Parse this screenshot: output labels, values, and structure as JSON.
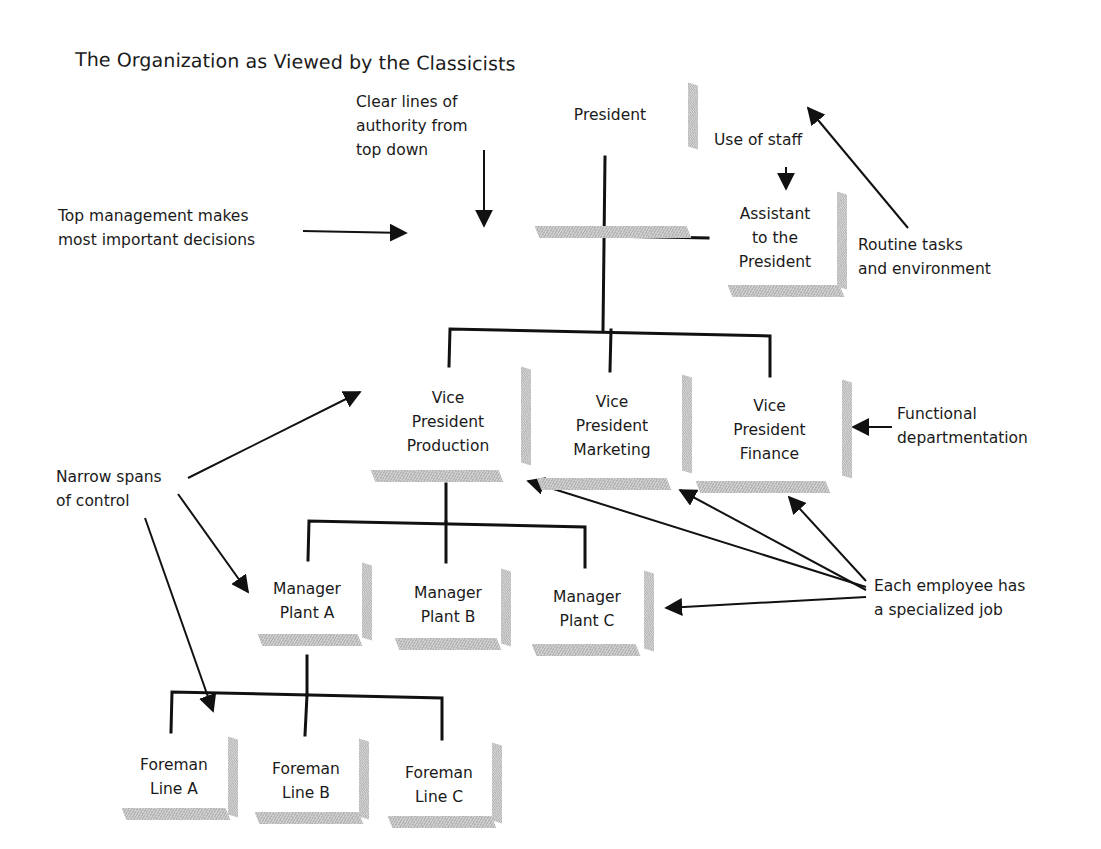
{
  "title": "The Organization as Viewed by the Classicists",
  "nodes": {
    "president": {
      "lines": [
        "President"
      ]
    },
    "assistant": {
      "lines": [
        "Assistant",
        "to the",
        "President"
      ]
    },
    "vp_production": {
      "lines": [
        "Vice",
        "President",
        "Production"
      ]
    },
    "vp_marketing": {
      "lines": [
        "Vice",
        "President",
        "Marketing"
      ]
    },
    "vp_finance": {
      "lines": [
        "Vice",
        "President",
        "Finance"
      ]
    },
    "manager_a": {
      "lines": [
        "Manager",
        "Plant A"
      ]
    },
    "manager_b": {
      "lines": [
        "Manager",
        "Plant B"
      ]
    },
    "manager_c": {
      "lines": [
        "Manager",
        "Plant C"
      ]
    },
    "foreman_a": {
      "lines": [
        "Foreman",
        "Line A"
      ]
    },
    "foreman_b": {
      "lines": [
        "Foreman",
        "Line B"
      ]
    },
    "foreman_c": {
      "lines": [
        "Foreman",
        "Line C"
      ]
    }
  },
  "annotations": {
    "clear_lines": {
      "lines": [
        "Clear lines of",
        "authority from",
        "top down"
      ]
    },
    "top_management": {
      "lines": [
        "Top management makes",
        "most important decisions"
      ]
    },
    "use_of_staff": {
      "lines": [
        "Use of staff"
      ]
    },
    "routine_tasks": {
      "lines": [
        "Routine tasks",
        "and environment"
      ]
    },
    "functional": {
      "lines": [
        "Functional",
        "departmentation"
      ]
    },
    "narrow_spans": {
      "lines": [
        "Narrow spans",
        "of control"
      ]
    },
    "specialized_job": {
      "lines": [
        "Each employee has",
        "a specialized job"
      ]
    }
  },
  "colors": {
    "line": "#111111",
    "box_shadow": "#c4c4c4",
    "background": "#ffffff"
  }
}
